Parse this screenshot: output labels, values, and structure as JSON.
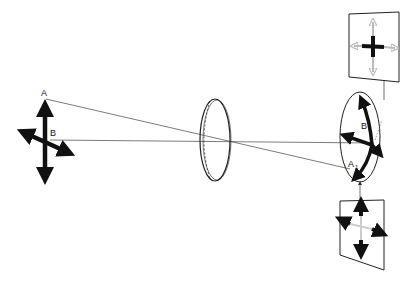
{
  "diagram": {
    "type": "optics-lens-image-formation",
    "labels": {
      "object_top": "A",
      "object_center": "B",
      "image_top": "A",
      "image_top_sub": "1",
      "image_center": "B",
      "image_center_sub": "1"
    },
    "elements": [
      {
        "name": "object-cross",
        "description": "four-headed arrow cross (object)"
      },
      {
        "name": "lens",
        "description": "biconvex lens in perspective"
      },
      {
        "name": "image-ellipse",
        "description": "inverted image on focal plane"
      },
      {
        "name": "screen-top",
        "description": "panel showing focused center with blurred arms"
      },
      {
        "name": "screen-bottom",
        "description": "panel showing focused arms with blurred center"
      }
    ],
    "colors": {
      "ink": "#111111",
      "ray": "#333333",
      "blur": "#bbbbbb"
    }
  }
}
